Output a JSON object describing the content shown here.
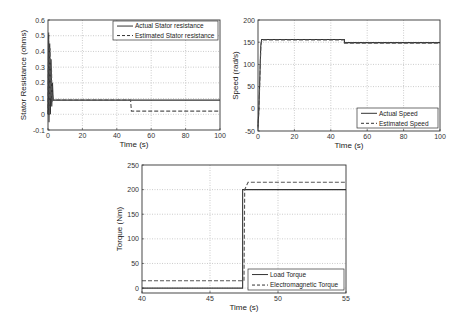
{
  "chart_data": [
    {
      "id": "stator",
      "type": "line",
      "title": "",
      "xlabel": "Time (s)",
      "ylabel": "Stator Resistance (ohms)",
      "xlim": [
        0,
        100
      ],
      "ylim": [
        -0.1,
        0.6
      ],
      "xticks": [
        0,
        20,
        40,
        60,
        80,
        100
      ],
      "yticks": [
        -0.1,
        0,
        0.1,
        0.2,
        0.3,
        0.4,
        0.5,
        0.6
      ],
      "ytick_labels": [
        "-0.1",
        "0",
        "0.1",
        "0.2",
        "0.3",
        "0.4",
        "0.5",
        "0.6"
      ],
      "grid": true,
      "legend_position": "upper right",
      "box": {
        "x0": 48,
        "x1": 220,
        "y0": 20,
        "y1": 130
      },
      "legend_box": {
        "x": 113,
        "y": 21,
        "w": 105,
        "h": 19
      },
      "series": [
        {
          "name": "Actual Stator resistance",
          "style": "solid",
          "x": [
            0,
            0.3,
            0.6,
            1.0,
            1.4,
            1.8,
            2.2,
            2.6,
            3.0,
            48,
            48,
            100
          ],
          "y": [
            0.0,
            0.5,
            -0.05,
            0.45,
            0.0,
            0.35,
            0.05,
            0.2,
            0.09,
            0.09,
            0.09,
            0.09
          ]
        },
        {
          "name": "Estimated Stator resistance",
          "style": "dashed",
          "x": [
            0,
            0.4,
            0.8,
            1.2,
            1.6,
            2.0,
            2.4,
            2.8,
            3.0,
            48,
            48.5,
            100
          ],
          "y": [
            0.0,
            0.52,
            0.0,
            0.42,
            0.1,
            0.3,
            0.08,
            0.12,
            0.09,
            0.09,
            0.02,
            0.02
          ]
        }
      ]
    },
    {
      "id": "speed",
      "type": "line",
      "title": "",
      "xlabel": "Time (s)",
      "ylabel": "Speed (rad/s)",
      "xlim": [
        0,
        100
      ],
      "ylim": [
        -50,
        200
      ],
      "xticks": [
        0,
        20,
        40,
        60,
        80,
        100
      ],
      "yticks": [
        -50,
        0,
        50,
        100,
        150,
        200
      ],
      "ytick_labels": [
        "-50",
        "0",
        "50",
        "100",
        "150",
        "200"
      ],
      "grid": true,
      "legend_position": "lower right",
      "box": {
        "x0": 258,
        "x1": 440,
        "y0": 20,
        "y1": 131
      },
      "legend_box": {
        "x": 357,
        "y": 108,
        "w": 81,
        "h": 20
      },
      "series": [
        {
          "name": "Actual Speed",
          "style": "solid",
          "x": [
            0,
            0.5,
            1.5,
            2.0,
            47.5,
            47.5,
            100
          ],
          "y": [
            -40,
            0,
            140,
            156,
            156,
            149,
            149
          ]
        },
        {
          "name": "Estimated Speed",
          "style": "dashed",
          "x": [
            0,
            0.6,
            1.6,
            2.2,
            47.5,
            47.5,
            100
          ],
          "y": [
            -45,
            10,
            145,
            155,
            155,
            148,
            148
          ]
        }
      ]
    },
    {
      "id": "torque",
      "type": "line",
      "title": "",
      "xlabel": "Time (s)",
      "ylabel": "Torque (Nm)",
      "xlim": [
        40,
        55
      ],
      "ylim": [
        -10,
        250
      ],
      "xticks": [
        40,
        45,
        50,
        55
      ],
      "yticks": [
        0,
        50,
        100,
        150,
        200,
        250
      ],
      "ytick_labels": [
        "0",
        "50",
        "100",
        "150",
        "200",
        "250"
      ],
      "grid": true,
      "legend_position": "lower right",
      "box": {
        "x0": 142,
        "x1": 346,
        "y0": 165,
        "y1": 293
      },
      "legend_box": {
        "x": 248,
        "y": 269,
        "w": 96,
        "h": 21
      },
      "series": [
        {
          "name": "Load Torque",
          "style": "solid",
          "x": [
            40,
            47.4,
            47.4,
            55
          ],
          "y": [
            0,
            0,
            200,
            200
          ]
        },
        {
          "name": "Electromagnetic Torque",
          "style": "dashed",
          "x": [
            40,
            47.5,
            47.55,
            47.8,
            55
          ],
          "y": [
            15,
            15,
            200,
            215,
            215
          ]
        }
      ]
    }
  ]
}
